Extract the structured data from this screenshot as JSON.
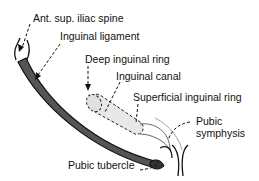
{
  "diagram": {
    "labels": {
      "asis": "Ant. sup. iliac spine",
      "inguinal_ligament": "Inguinal ligament",
      "deep_ring": "Deep inguinal ring",
      "inguinal_canal": "Inguinal canal",
      "superficial_ring": "Superficial inguinal ring",
      "pubic_symphysis_1": "Pubic",
      "pubic_symphysis_2": "symphysis",
      "pubic_tubercle": "Pubic tubercle"
    },
    "colors": {
      "ligament_fill": "#555555",
      "outline": "#111111",
      "canal_fill": "#e6e6e6",
      "background": "#ffffff"
    }
  }
}
